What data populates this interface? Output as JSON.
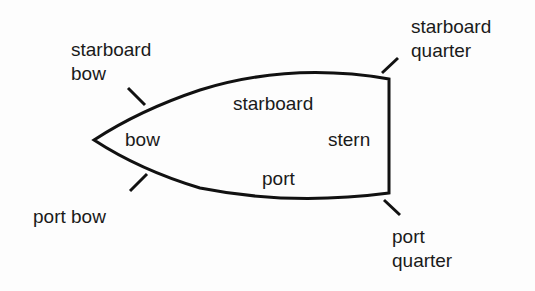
{
  "diagram": {
    "colors": {
      "line": "#111111",
      "text": "#1a1a1a",
      "background": "#fdfdfd"
    },
    "labels": {
      "starboard_bow": "starboard\nbow",
      "starboard_quarter": "starboard\nquarter",
      "starboard": "starboard",
      "bow": "bow",
      "stern": "stern",
      "port": "port",
      "port_bow": "port bow",
      "port_quarter": "port\nquarter"
    }
  }
}
